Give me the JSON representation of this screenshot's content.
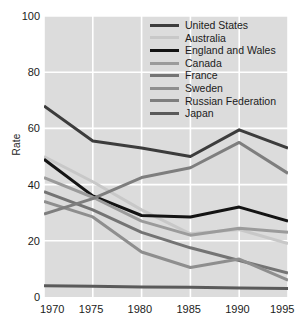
{
  "chart_data": {
    "type": "line",
    "title": "",
    "xlabel": "",
    "ylabel": "Rate",
    "x": [
      1970,
      1975,
      1980,
      1985,
      1990,
      1995
    ],
    "xtick_labels": [
      "1970",
      "1975",
      "1980",
      "1985",
      "1990",
      "1995"
    ],
    "ytick_labels": [
      "0",
      "20",
      "40",
      "60",
      "80",
      "100"
    ],
    "yticks": [
      0,
      20,
      40,
      60,
      80,
      100
    ],
    "xlim": [
      1970,
      1995
    ],
    "ylim": [
      0,
      100
    ],
    "grid": true,
    "legend_position": "top-right",
    "plot_background": "#dcdcdc",
    "gridline_color": "#ffffff",
    "series": [
      {
        "name": "United States",
        "color": "#3c3c3c",
        "width": 3.0,
        "values": [
          68,
          55.5,
          53,
          50,
          59.5,
          53
        ]
      },
      {
        "name": "Australia",
        "color": "#c8c8c8",
        "width": 3.0,
        "values": [
          50,
          41,
          31,
          22.5,
          24,
          19
        ]
      },
      {
        "name": "England and Wales",
        "color": "#141414",
        "width": 3.0,
        "values": [
          49,
          36,
          29,
          28.5,
          32,
          27
        ]
      },
      {
        "name": "Canada",
        "color": "#9b9b9b",
        "width": 3.0,
        "values": [
          42.5,
          35.5,
          27,
          22,
          24.5,
          23
        ]
      },
      {
        "name": "France",
        "color": "#747474",
        "width": 3.0,
        "values": [
          37.5,
          31,
          23,
          17.5,
          13,
          8.5
        ]
      },
      {
        "name": "Sweden",
        "color": "#8e8e8e",
        "width": 3.0,
        "values": [
          34,
          28.5,
          16,
          10.5,
          13.5,
          6
        ]
      },
      {
        "name": "Russian Federation",
        "color": "#7e7e7e",
        "width": 3.0,
        "values": [
          29.5,
          35,
          42.5,
          46,
          55,
          44
        ]
      },
      {
        "name": "Japan",
        "color": "#5a5a5a",
        "width": 3.0,
        "values": [
          4,
          3.8,
          3.6,
          3.5,
          3.2,
          3
        ]
      }
    ]
  }
}
